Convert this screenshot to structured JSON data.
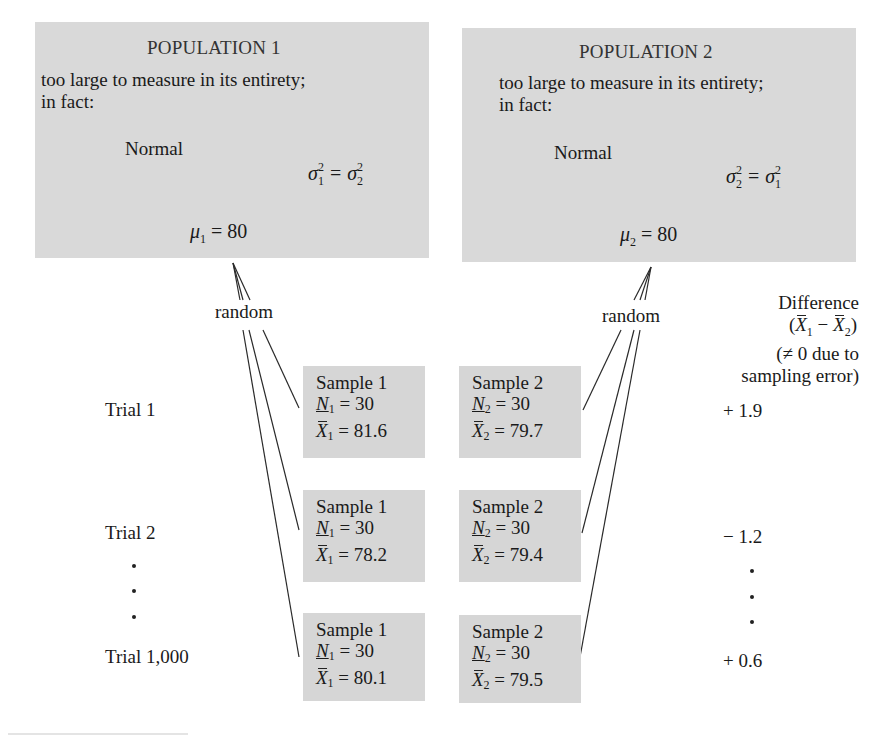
{
  "populations": [
    {
      "title": "POPULATION 1",
      "desc_line1": "too large to measure in its entirety;",
      "desc_line2": "in fact:",
      "distribution_label": "Normal",
      "variance_lhs_sub": "1",
      "variance_rhs_sub": "2",
      "mean_symbol": "μ",
      "mean_sub": "1",
      "mean_value": "= 80"
    },
    {
      "title": "POPULATION 2",
      "desc_line1": "too large to measure in its entirety;",
      "desc_line2": "in fact:",
      "distribution_label": "Normal",
      "variance_lhs_sub": "2",
      "variance_rhs_sub": "1",
      "mean_symbol": "μ",
      "mean_sub": "2",
      "mean_value": "= 80"
    }
  ],
  "sampling_label": "random",
  "difference_header": {
    "line1": "Difference",
    "line2": "(X̄₁ − X̄₂)",
    "line3": "(≠ 0 due to",
    "line4": "sampling error)"
  },
  "trials": [
    {
      "label": "Trial 1",
      "sample1": {
        "title": "Sample 1",
        "n_sub": "1",
        "n_value": "= 30",
        "mean_sub": "1",
        "mean_value": "= 81.6"
      },
      "sample2": {
        "title": "Sample 2",
        "n_sub": "2",
        "n_value": "= 30",
        "mean_sub": "2",
        "mean_value": "= 79.7"
      },
      "difference": "+ 1.9"
    },
    {
      "label": "Trial 2",
      "sample1": {
        "title": "Sample 1",
        "n_sub": "1",
        "n_value": "= 30",
        "mean_sub": "1",
        "mean_value": "= 78.2"
      },
      "sample2": {
        "title": "Sample 2",
        "n_sub": "2",
        "n_value": "= 30",
        "mean_sub": "2",
        "mean_value": "= 79.4"
      },
      "difference": "− 1.2"
    },
    {
      "label": "Trial 1,000",
      "sample1": {
        "title": "Sample 1",
        "n_sub": "1",
        "n_value": "= 30",
        "mean_sub": "1",
        "mean_value": "= 80.1"
      },
      "sample2": {
        "title": "Sample 2",
        "n_sub": "2",
        "n_value": "= 30",
        "mean_sub": "2",
        "mean_value": "= 79.5"
      },
      "difference": "+ 0.6"
    }
  ],
  "symbols": {
    "sigma": "σ",
    "squared": "2",
    "N": "N",
    "X": "X",
    "equals": "="
  }
}
